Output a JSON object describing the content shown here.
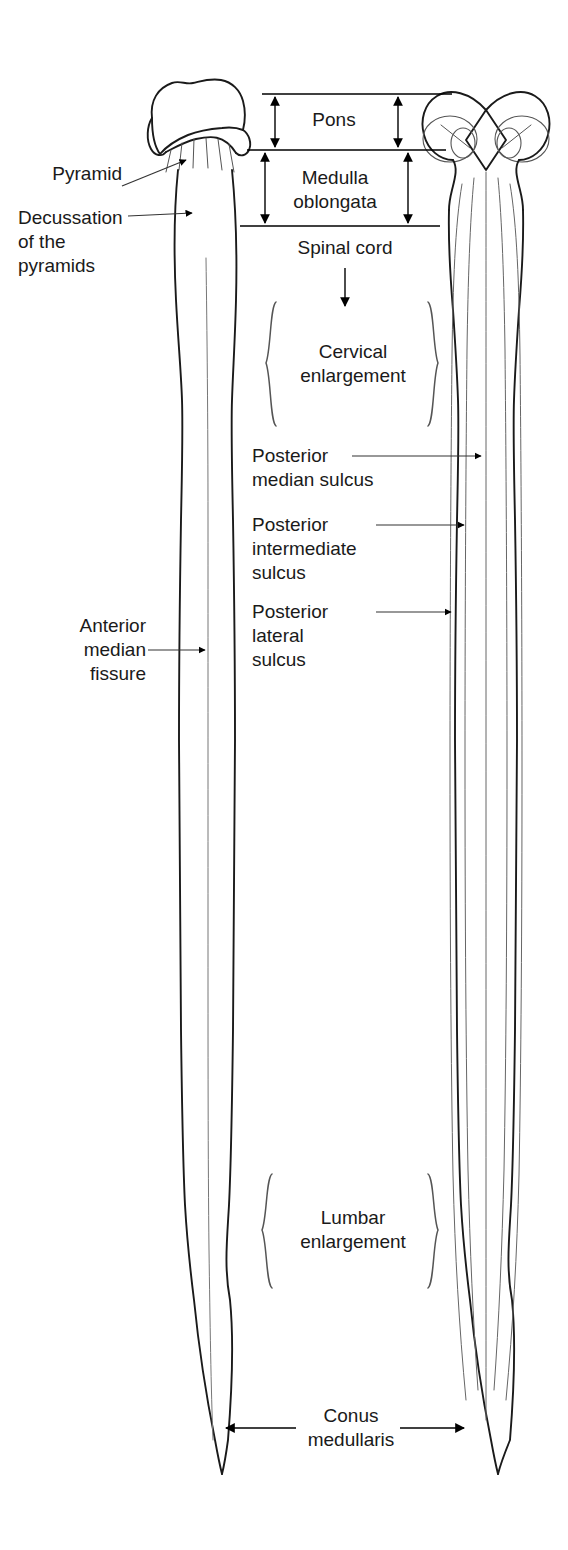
{
  "figure": {
    "views": [
      {
        "name": "anterior-view",
        "side": "left"
      },
      {
        "name": "posterior-view",
        "side": "right"
      }
    ],
    "stroke_color": "#1a1a1a",
    "background_color": "#ffffff"
  },
  "labels": {
    "pyramid": "Pyramid",
    "decussation": "Decussation\nof the\npyramids",
    "anterior_median_fissure": "Anterior\nmedian\nfissure",
    "pons": "Pons",
    "medulla_oblongata": "Medulla\noblongata",
    "spinal_cord": "Spinal cord",
    "cervical_enlargement": "Cervical\nenlargement",
    "posterior_median_sulcus": "Posterior\nmedian sulcus",
    "posterior_intermediate_sulcus": "Posterior\nintermediate\nsulcus",
    "posterior_lateral_sulcus": "Posterior\nlateral\nsulcus",
    "lumbar_enlargement": "Lumbar\nenlargement",
    "conus_medullaris": "Conus\nmedullaris"
  }
}
